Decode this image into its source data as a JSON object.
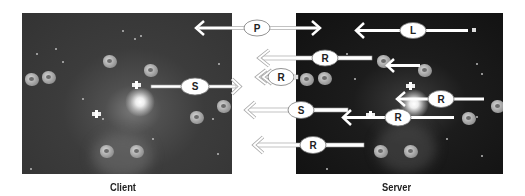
{
  "panels": {
    "client": {
      "caption": "Client"
    },
    "server": {
      "caption": "Server"
    }
  },
  "messages": [
    {
      "id": "P",
      "label": "P",
      "direction": "bidirectional",
      "between": "client-server",
      "style": "solid"
    },
    {
      "id": "L",
      "label": "L",
      "direction": "left",
      "location": "server",
      "style": "solid"
    },
    {
      "id": "R1",
      "label": "R",
      "direction": "server-to-client",
      "style": "hollow"
    },
    {
      "id": "R2",
      "label": "R",
      "direction": "server-to-client",
      "style": "double-hollow"
    },
    {
      "id": "S1",
      "label": "S",
      "direction": "client-to-server",
      "style": "hollow-head"
    },
    {
      "id": "R3",
      "label": "R",
      "direction": "left",
      "location": "server",
      "style": "solid"
    },
    {
      "id": "S2",
      "label": "S",
      "direction": "server-to-client",
      "style": "hollow"
    },
    {
      "id": "R4",
      "label": "R",
      "direction": "left",
      "location": "server",
      "style": "solid"
    },
    {
      "id": "R5",
      "label": "R",
      "direction": "server-to-client",
      "style": "hollow"
    }
  ],
  "colors": {
    "client_bg": "#3c3c3c",
    "server_bg": "#151515",
    "arrow": "#ffffff",
    "arrow_outline": "#888888",
    "bubble_fill": "#ffffff",
    "caption_text": "#222222"
  }
}
